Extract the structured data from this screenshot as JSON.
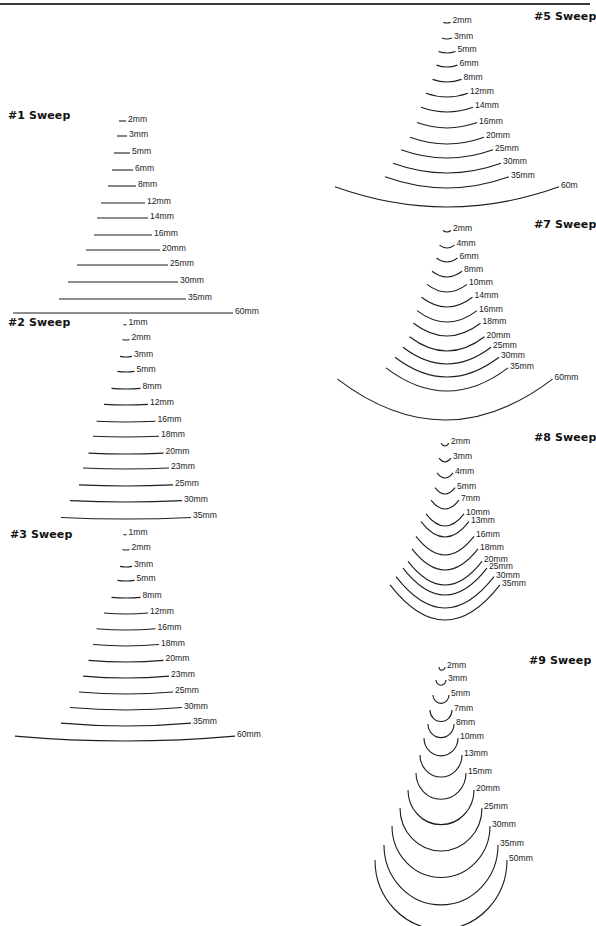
{
  "page": {
    "background": "#ffffff",
    "ink_color": "#1e1e1e"
  },
  "sweeps": [
    {
      "id": "sweep-1",
      "title": "#1 Sweep",
      "title_pos": [
        8,
        115
      ],
      "kind": "flat",
      "profiles": [
        {
          "label": "2mm",
          "x1": 119,
          "x2": 126,
          "y": 121
        },
        {
          "label": "3mm",
          "x1": 117,
          "x2": 127,
          "y": 136
        },
        {
          "label": "5mm",
          "x1": 114,
          "x2": 130,
          "y": 153
        },
        {
          "label": "6mm",
          "x1": 112,
          "x2": 133,
          "y": 170
        },
        {
          "label": "8mm",
          "x1": 108,
          "x2": 136,
          "y": 186
        },
        {
          "label": "12mm",
          "x1": 101,
          "x2": 145,
          "y": 203
        },
        {
          "label": "14mm",
          "x1": 97,
          "x2": 148,
          "y": 218
        },
        {
          "label": "16mm",
          "x1": 94,
          "x2": 152,
          "y": 235
        },
        {
          "label": "20mm",
          "x1": 86,
          "x2": 160,
          "y": 250
        },
        {
          "label": "25mm",
          "x1": 77,
          "x2": 168,
          "y": 265
        },
        {
          "label": "30mm",
          "x1": 68,
          "x2": 178,
          "y": 282
        },
        {
          "label": "35mm",
          "x1": 59,
          "x2": 186,
          "y": 299
        },
        {
          "label": "60mm",
          "x1": 13,
          "x2": 233,
          "y": 313
        }
      ]
    },
    {
      "id": "sweep-2",
      "title": "#2 Sweep",
      "title_pos": [
        8,
        322
      ],
      "kind": "arc",
      "sag_scale": 0.012,
      "profiles": [
        {
          "label": "1mm",
          "cx": 125,
          "w": 3,
          "y": 325
        },
        {
          "label": "2mm",
          "cx": 126,
          "w": 7,
          "y": 340
        },
        {
          "label": "3mm",
          "cx": 126,
          "w": 12,
          "y": 357
        },
        {
          "label": "5mm",
          "cx": 126,
          "w": 17,
          "y": 372
        },
        {
          "label": "8mm",
          "cx": 126,
          "w": 29,
          "y": 389
        },
        {
          "label": "12mm",
          "cx": 126,
          "w": 44,
          "y": 405
        },
        {
          "label": "16mm",
          "cx": 126,
          "w": 59,
          "y": 422
        },
        {
          "label": "18mm",
          "cx": 126,
          "w": 66,
          "y": 437
        },
        {
          "label": "20mm",
          "cx": 126,
          "w": 75,
          "y": 454
        },
        {
          "label": "23mm",
          "cx": 126,
          "w": 86,
          "y": 469
        },
        {
          "label": "25mm",
          "cx": 126,
          "w": 94,
          "y": 486
        },
        {
          "label": "30mm",
          "cx": 126,
          "w": 112,
          "y": 502
        },
        {
          "label": "35mm",
          "cx": 126,
          "w": 130,
          "y": 519
        }
      ]
    },
    {
      "id": "sweep-3",
      "title": "#3 Sweep",
      "title_pos": [
        10,
        534
      ],
      "kind": "arc",
      "sag_scale": 0.022,
      "profiles": [
        {
          "label": "1mm",
          "cx": 125,
          "w": 3,
          "y": 535
        },
        {
          "label": "2mm",
          "cx": 126,
          "w": 7,
          "y": 550
        },
        {
          "label": "3mm",
          "cx": 126,
          "w": 12,
          "y": 567
        },
        {
          "label": "5mm",
          "cx": 126,
          "w": 17,
          "y": 581
        },
        {
          "label": "8mm",
          "cx": 126,
          "w": 29,
          "y": 598
        },
        {
          "label": "12mm",
          "cx": 126,
          "w": 44,
          "y": 614
        },
        {
          "label": "16mm",
          "cx": 126,
          "w": 59,
          "y": 630
        },
        {
          "label": "18mm",
          "cx": 126,
          "w": 66,
          "y": 646
        },
        {
          "label": "20mm",
          "cx": 126,
          "w": 75,
          "y": 662
        },
        {
          "label": "23mm",
          "cx": 126,
          "w": 86,
          "y": 678
        },
        {
          "label": "25mm",
          "cx": 126,
          "w": 94,
          "y": 694
        },
        {
          "label": "30mm",
          "cx": 126,
          "w": 112,
          "y": 710
        },
        {
          "label": "35mm",
          "cx": 126,
          "w": 130,
          "y": 726
        },
        {
          "label": "60mm",
          "cx": 125,
          "w": 220,
          "y": 741
        }
      ]
    },
    {
      "id": "sweep-5",
      "title": "#5 Sweep",
      "title_pos": [
        534,
        16
      ],
      "kind": "arc",
      "sag_scale": 0.09,
      "profiles": [
        {
          "label": "2mm",
          "cx": 447,
          "w": 7,
          "y": 23
        },
        {
          "label": "3mm",
          "cx": 447,
          "w": 10,
          "y": 39
        },
        {
          "label": "5mm",
          "cx": 447,
          "w": 17,
          "y": 53
        },
        {
          "label": "6mm",
          "cx": 447,
          "w": 21,
          "y": 67
        },
        {
          "label": "8mm",
          "cx": 447,
          "w": 29,
          "y": 82
        },
        {
          "label": "12mm",
          "cx": 447,
          "w": 42,
          "y": 97
        },
        {
          "label": "14mm",
          "cx": 447,
          "w": 52,
          "y": 112
        },
        {
          "label": "16mm",
          "cx": 447,
          "w": 60,
          "y": 128
        },
        {
          "label": "20mm",
          "cx": 447,
          "w": 74,
          "y": 144
        },
        {
          "label": "25mm",
          "cx": 447,
          "w": 92,
          "y": 158
        },
        {
          "label": "30mm",
          "cx": 447,
          "w": 108,
          "y": 173
        },
        {
          "label": "35mm",
          "cx": 447,
          "w": 124,
          "y": 188
        },
        {
          "label": "60mm",
          "cx": 447,
          "w": 224,
          "y": 207,
          "label_text": "60m"
        }
      ]
    },
    {
      "id": "sweep-7",
      "title": "#7 Sweep",
      "title_pos": [
        534,
        224
      ],
      "kind": "arc",
      "sag_scale": 0.19,
      "profiles": [
        {
          "label": "2mm",
          "cx": 447,
          "w": 8,
          "y": 232
        },
        {
          "label": "4mm",
          "cx": 447,
          "w": 15,
          "y": 248
        },
        {
          "label": "6mm",
          "cx": 447,
          "w": 21,
          "y": 262
        },
        {
          "label": "8mm",
          "cx": 447,
          "w": 30,
          "y": 277
        },
        {
          "label": "10mm",
          "cx": 447,
          "w": 40,
          "y": 292
        },
        {
          "label": "14mm",
          "cx": 447,
          "w": 51,
          "y": 307
        },
        {
          "label": "16mm",
          "cx": 447,
          "w": 60,
          "y": 322
        },
        {
          "label": "18mm",
          "cx": 447,
          "w": 67,
          "y": 336
        },
        {
          "label": "20mm",
          "cx": 447,
          "w": 75,
          "y": 351
        },
        {
          "label": "25mm",
          "cx": 447,
          "w": 88,
          "y": 364
        },
        {
          "label": "30mm",
          "cx": 447,
          "w": 104,
          "y": 377
        },
        {
          "label": "35mm",
          "cx": 447,
          "w": 122,
          "y": 391
        },
        {
          "label": "60mm",
          "cx": 445,
          "w": 215,
          "y": 420
        }
      ]
    },
    {
      "id": "sweep-8",
      "title": "#8 Sweep",
      "title_pos": [
        534,
        437
      ],
      "kind": "arc",
      "sag_scale": 0.32,
      "profiles": [
        {
          "label": "2mm",
          "cx": 445,
          "w": 8,
          "y": 446
        },
        {
          "label": "3mm",
          "cx": 445,
          "w": 12,
          "y": 462
        },
        {
          "label": "4mm",
          "cx": 445,
          "w": 16,
          "y": 478
        },
        {
          "label": "5mm",
          "cx": 445,
          "w": 20,
          "y": 494
        },
        {
          "label": "7mm",
          "cx": 445,
          "w": 28,
          "y": 509
        },
        {
          "label": "10mm",
          "cx": 445,
          "w": 38,
          "y": 526
        },
        {
          "label": "13mm",
          "cx": 445,
          "w": 48,
          "y": 537
        },
        {
          "label": "16mm",
          "cx": 445,
          "w": 58,
          "y": 555
        },
        {
          "label": "18mm",
          "cx": 445,
          "w": 66,
          "y": 570
        },
        {
          "label": "20mm",
          "cx": 445,
          "w": 74,
          "y": 585
        },
        {
          "label": "25mm",
          "cx": 445,
          "w": 84,
          "y": 595
        },
        {
          "label": "30mm",
          "cx": 445,
          "w": 98,
          "y": 608
        },
        {
          "label": "35mm",
          "cx": 445,
          "w": 110,
          "y": 620
        }
      ]
    },
    {
      "id": "sweep-9",
      "title": "#9 Sweep",
      "title_pos": [
        529,
        660
      ],
      "kind": "semicircle",
      "profiles": [
        {
          "label": "2mm",
          "cx": 442,
          "r": 3,
          "y": 667
        },
        {
          "label": "3mm",
          "cx": 441,
          "r": 5,
          "y": 680
        },
        {
          "label": "5mm",
          "cx": 441,
          "r": 8,
          "y": 695
        },
        {
          "label": "7mm",
          "cx": 441,
          "r": 11,
          "y": 710
        },
        {
          "label": "8mm",
          "cx": 441,
          "r": 13,
          "y": 724
        },
        {
          "label": "10mm",
          "cx": 441,
          "r": 17,
          "y": 738
        },
        {
          "label": "13mm",
          "cx": 441,
          "r": 21,
          "y": 755
        },
        {
          "label": "15mm",
          "cx": 441,
          "r": 25,
          "y": 773
        },
        {
          "label": "20mm",
          "cx": 441,
          "r": 33,
          "y": 790
        },
        {
          "label": "25mm",
          "cx": 441,
          "r": 41,
          "y": 808
        },
        {
          "label": "30mm",
          "cx": 441,
          "r": 49,
          "y": 826
        },
        {
          "label": "35mm",
          "cx": 441,
          "r": 57,
          "y": 845
        },
        {
          "label": "50mm",
          "cx": 441,
          "r": 66,
          "y": 860
        }
      ]
    }
  ]
}
